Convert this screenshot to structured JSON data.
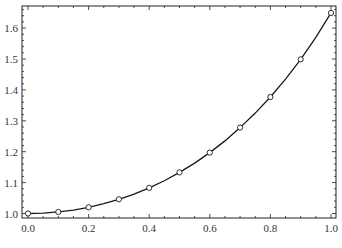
{
  "chart_data": {
    "type": "line",
    "title": "",
    "xlabel": "",
    "ylabel": "",
    "xlim": [
      0.0,
      1.0
    ],
    "ylim": [
      0.98,
      1.66
    ],
    "grid": false,
    "legend": null,
    "x_ticks": [
      "0.0",
      "0.2",
      "0.4",
      "0.6",
      "0.8",
      "1.0"
    ],
    "y_ticks": [
      "1.0",
      "1.1",
      "1.2",
      "1.3",
      "1.4",
      "1.5",
      "1.6"
    ],
    "series": [
      {
        "name": "curve",
        "style": "solid line",
        "color": "#1a1a1a",
        "x": [
          0.0,
          0.05,
          0.1,
          0.15,
          0.2,
          0.25,
          0.3,
          0.35,
          0.4,
          0.45,
          0.5,
          0.55,
          0.6,
          0.65,
          0.7,
          0.75,
          0.8,
          0.85,
          0.9,
          0.95,
          1.0
        ],
        "values": [
          1.0,
          1.001,
          1.005,
          1.011,
          1.02,
          1.032,
          1.046,
          1.063,
          1.083,
          1.106,
          1.133,
          1.163,
          1.197,
          1.235,
          1.278,
          1.325,
          1.377,
          1.435,
          1.499,
          1.57,
          1.649
        ]
      },
      {
        "name": "points",
        "style": "open circle markers",
        "color": "#1a1a1a",
        "x": [
          0.0,
          0.1,
          0.2,
          0.3,
          0.4,
          0.5,
          0.6,
          0.7,
          0.8,
          0.9,
          1.0
        ],
        "values": [
          1.0,
          1.005,
          1.02,
          1.046,
          1.083,
          1.133,
          1.197,
          1.278,
          1.377,
          1.499,
          1.649
        ]
      }
    ]
  },
  "layout": {
    "frame": {
      "left": 22,
      "top": 6,
      "right": 336,
      "bottom": 218
    },
    "x_map": {
      "x0": 28,
      "x1": 331
    },
    "y_map": {
      "v_at_1_0": 213.5,
      "px_per_0_1": 30.9
    }
  }
}
